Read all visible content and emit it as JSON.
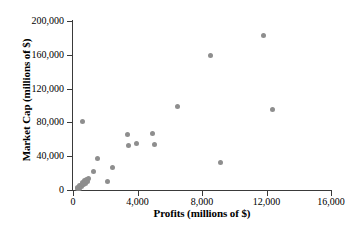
{
  "chart_data": {
    "type": "scatter",
    "title": "",
    "xlabel": "Profits (millions of $)",
    "ylabel": "Market Cap (millions of $)",
    "xlim": [
      0,
      16000
    ],
    "ylim": [
      0,
      200000
    ],
    "xticks": [
      0,
      4000,
      8000,
      12000,
      16000
    ],
    "yticks": [
      0,
      40000,
      80000,
      120000,
      160000,
      200000
    ],
    "xtick_labels": [
      "0",
      "4,000",
      "8,000",
      "12,000",
      "16,000"
    ],
    "ytick_labels": [
      "0",
      "40,000",
      "80,000",
      "120,000",
      "160,000",
      "200,000"
    ],
    "grid": false,
    "legend": false,
    "marker_color": "#8e8e8e",
    "axis_color": "#3a3a3a",
    "points": [
      {
        "x": 250,
        "y": 1500
      },
      {
        "x": 300,
        "y": 3000
      },
      {
        "x": 380,
        "y": 2000
      },
      {
        "x": 420,
        "y": 5500
      },
      {
        "x": 500,
        "y": 4000
      },
      {
        "x": 560,
        "y": 7000
      },
      {
        "x": 600,
        "y": 9000
      },
      {
        "x": 650,
        "y": 6000
      },
      {
        "x": 700,
        "y": 11000
      },
      {
        "x": 760,
        "y": 8000
      },
      {
        "x": 820,
        "y": 12500
      },
      {
        "x": 900,
        "y": 10000
      },
      {
        "x": 950,
        "y": 13500
      },
      {
        "x": 620,
        "y": 81000
      },
      {
        "x": 1250,
        "y": 22000
      },
      {
        "x": 1500,
        "y": 37000
      },
      {
        "x": 2150,
        "y": 10500
      },
      {
        "x": 2450,
        "y": 27000
      },
      {
        "x": 3400,
        "y": 66000
      },
      {
        "x": 3450,
        "y": 53000
      },
      {
        "x": 3950,
        "y": 55000
      },
      {
        "x": 4950,
        "y": 67000
      },
      {
        "x": 5050,
        "y": 54000
      },
      {
        "x": 6450,
        "y": 99000
      },
      {
        "x": 8550,
        "y": 159000
      },
      {
        "x": 9150,
        "y": 33000
      },
      {
        "x": 11800,
        "y": 183000
      },
      {
        "x": 12350,
        "y": 95000
      }
    ]
  }
}
